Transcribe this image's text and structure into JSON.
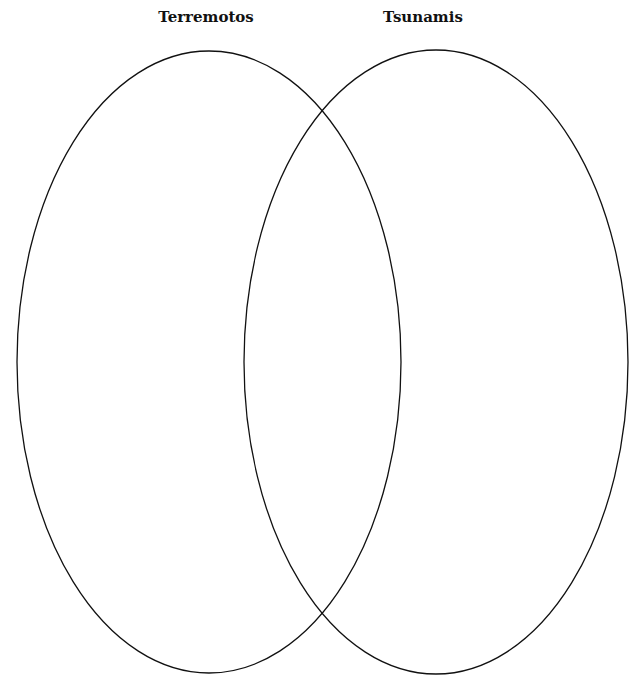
{
  "diagram": {
    "type": "venn",
    "sets": [
      {
        "label": "Terremotos",
        "cx": 209,
        "cy": 362,
        "rx": 192,
        "ry": 311,
        "label_x": 206
      },
      {
        "label": "Tsunamis",
        "cx": 436,
        "cy": 362,
        "rx": 192,
        "ry": 312,
        "label_x": 423
      }
    ],
    "stroke_color": "#111111",
    "background": "#ffffff"
  }
}
